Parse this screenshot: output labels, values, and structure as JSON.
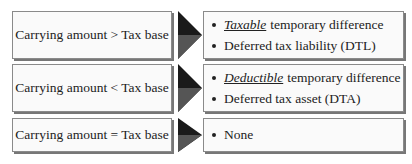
{
  "rows": [
    {
      "condition": "Carrying amount > Tax base",
      "results": [
        {
          "emphasis": "Taxable",
          "text": "temporary difference"
        },
        {
          "emphasis": "",
          "text": "Deferred tax liability (DTL)"
        }
      ]
    },
    {
      "condition": "Carrying amount < Tax base",
      "results": [
        {
          "emphasis": "Deductible",
          "text": "temporary difference"
        },
        {
          "emphasis": "",
          "text": "Deferred tax asset (DTA)"
        }
      ]
    },
    {
      "condition": "Carrying amount = Tax base",
      "results": [
        {
          "emphasis": "",
          "text": "None"
        }
      ]
    }
  ],
  "colors": {
    "arrow": "#1a1a1a",
    "border": "#8a8a8a",
    "box_bg": "#fafafa"
  }
}
